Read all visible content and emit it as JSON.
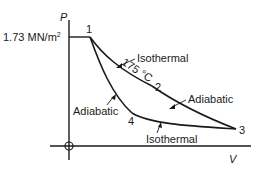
{
  "diagram": {
    "axes": {
      "y_label": "P",
      "x_label": "V",
      "pressure_value": "1.73 MN/m",
      "pressure_unit_superscript": "2"
    },
    "points": [
      {
        "id": "1",
        "label": "1"
      },
      {
        "id": "2",
        "label": "2"
      },
      {
        "id": "3",
        "label": "3"
      },
      {
        "id": "4",
        "label": "4"
      }
    ],
    "processes": [
      {
        "from": "1",
        "to": "2",
        "type": "Isothermal",
        "label": "Isothermal"
      },
      {
        "from": "2",
        "to": "3",
        "type": "Adiabatic",
        "label": "Adiabatic"
      },
      {
        "from": "1",
        "to": "4",
        "type": "Adiabatic",
        "label": "Adiabatic"
      },
      {
        "from": "4",
        "to": "3",
        "type": "Isothermal",
        "label": "Isothermal"
      }
    ],
    "temperature_annotation": "175 °C"
  }
}
